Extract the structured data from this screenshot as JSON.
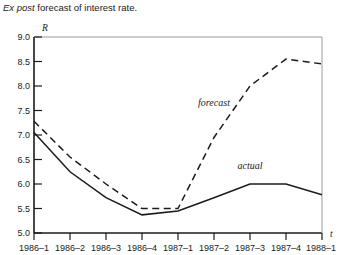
{
  "caption": {
    "italic_lead": "Ex post",
    "rest": " forecast of interest rate."
  },
  "axes": {
    "y_axis_name": "R",
    "x_axis_name": "t"
  },
  "chart_data": {
    "type": "line",
    "title": "Ex post forecast of interest rate.",
    "xlabel": "t",
    "ylabel": "R",
    "grid": false,
    "legend": "inline-annotations",
    "categories": [
      "1986–1",
      "1986–2",
      "1986–3",
      "1986–4",
      "1987–1",
      "1987–2",
      "1987–3",
      "1987–4",
      "1988–1"
    ],
    "ylim": [
      5.0,
      9.0
    ],
    "ytick_labels": [
      "9.0",
      "8.5",
      "8.0",
      "7.5",
      "7.0",
      "6.5",
      "6.0",
      "5.5",
      "5.0"
    ],
    "ytick_values": [
      9.0,
      8.5,
      8.0,
      7.5,
      7.0,
      6.5,
      6.0,
      5.5,
      5.0
    ],
    "series": [
      {
        "name": "actual",
        "style": "solid",
        "color": "#1b1b1b",
        "values": [
          7.05,
          6.25,
          5.72,
          5.37,
          5.45,
          5.72,
          6.0,
          6.0,
          5.78
        ]
      },
      {
        "name": "forecast",
        "style": "dashed",
        "color": "#1b1b1b",
        "values": [
          7.28,
          6.55,
          6.0,
          5.5,
          5.5,
          6.95,
          8.0,
          8.55,
          8.45
        ]
      }
    ],
    "annotations": [
      {
        "text": "forecast",
        "x_category": "1987–2",
        "y_value": 7.6
      },
      {
        "text": "actual",
        "x_category": "1987–3",
        "y_value": 6.3
      }
    ]
  }
}
